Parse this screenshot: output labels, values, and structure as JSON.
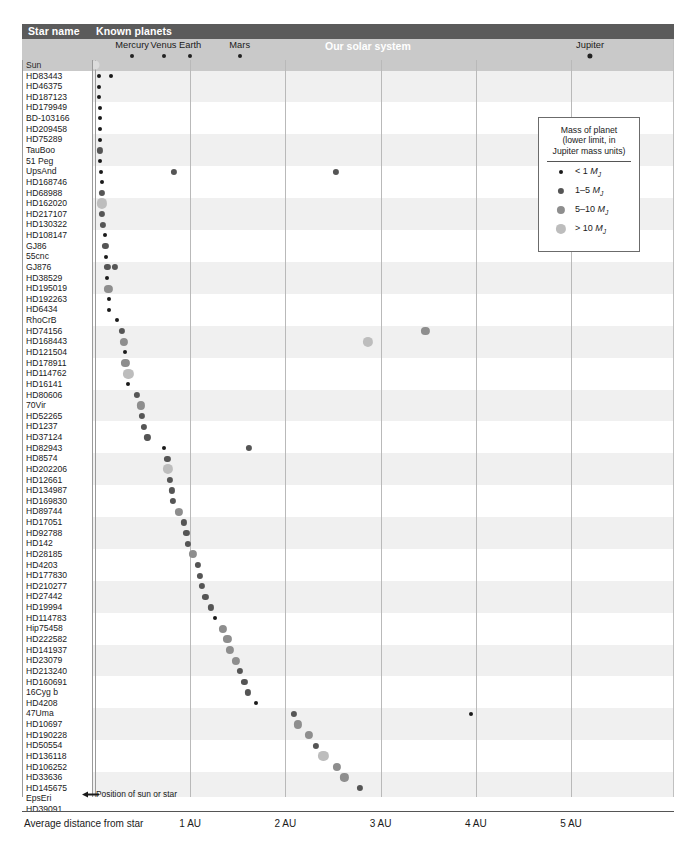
{
  "header": {
    "star_name_label": "Star name",
    "known_planets_label": "Known planets",
    "solar_system_label": "Our solar system"
  },
  "axis": {
    "title": "Average distance from star",
    "ticks": [
      {
        "label": "1 AU",
        "au": 1
      },
      {
        "label": "2 AU",
        "au": 2
      },
      {
        "label": "3 AU",
        "au": 3
      },
      {
        "label": "4 AU",
        "au": 4
      },
      {
        "label": "5 AU",
        "au": 5
      }
    ]
  },
  "annotation": {
    "pointer_text": "Position of sun or star"
  },
  "legend": {
    "title_line1": "Mass of planet",
    "title_line2": "(lower limit, in",
    "title_line3": "Jupiter mass units)",
    "entries": [
      {
        "label": "< 1",
        "unit": "MJ",
        "size": 4.0,
        "color": "#1a1a1a"
      },
      {
        "label": "1–5",
        "unit": "MJ",
        "size": 6.2,
        "color": "#555555"
      },
      {
        "label": "5–10",
        "unit": "MJ",
        "size": 8.2,
        "color": "#8e8e8e"
      },
      {
        "label": "> 10",
        "unit": "MJ",
        "size": 10.2,
        "color": "#bdbdbd"
      }
    ]
  },
  "chart_data": {
    "type": "scatter",
    "xlabel": "Average distance from star (AU)",
    "ylabel": "Star name",
    "xlim": [
      0,
      5.6
    ],
    "grid": true,
    "legend_position": "upper-right",
    "mass_classes": [
      {
        "name": "< 1 MJ",
        "color": "#1a1a1a",
        "size": 4.0
      },
      {
        "name": "1-5 MJ",
        "color": "#555555",
        "size": 6.2
      },
      {
        "name": "5-10 MJ",
        "color": "#8e8e8e",
        "size": 8.2
      },
      {
        "name": "> 10 MJ",
        "color": "#bdbdbd",
        "size": 10.2
      }
    ],
    "solar_system": {
      "star_label": "Sun",
      "planets": [
        {
          "name": "Mercury",
          "au": 0.39,
          "size": 4.0,
          "color": "#222222"
        },
        {
          "name": "Venus",
          "au": 0.72,
          "size": 4.0,
          "color": "#222222"
        },
        {
          "name": "Earth",
          "au": 1.0,
          "size": 4.0,
          "color": "#222222"
        },
        {
          "name": "Mars",
          "au": 1.52,
          "size": 4.0,
          "color": "#222222"
        },
        {
          "name": "Jupiter",
          "au": 5.2,
          "size": 5.2,
          "color": "#222222"
        }
      ]
    },
    "rows": [
      {
        "star": "HD83443",
        "planets": [
          {
            "au": 0.04,
            "m": 0
          },
          {
            "au": 0.17,
            "m": 0
          }
        ]
      },
      {
        "star": "HD46375",
        "planets": [
          {
            "au": 0.04,
            "m": 0
          }
        ]
      },
      {
        "star": "HD187123",
        "planets": [
          {
            "au": 0.04,
            "m": 0
          }
        ]
      },
      {
        "star": "HD179949",
        "planets": [
          {
            "au": 0.05,
            "m": 0
          }
        ]
      },
      {
        "star": "BD-103166",
        "planets": [
          {
            "au": 0.05,
            "m": 0
          }
        ]
      },
      {
        "star": "HD209458",
        "planets": [
          {
            "au": 0.05,
            "m": 0
          }
        ]
      },
      {
        "star": "HD75289",
        "planets": [
          {
            "au": 0.05,
            "m": 0
          }
        ]
      },
      {
        "star": "TauBoo",
        "planets": [
          {
            "au": 0.05,
            "m": 1
          }
        ]
      },
      {
        "star": "51 Peg",
        "planets": [
          {
            "au": 0.05,
            "m": 0
          }
        ]
      },
      {
        "star": "UpsAnd",
        "planets": [
          {
            "au": 0.06,
            "m": 0
          },
          {
            "au": 0.83,
            "m": 1
          },
          {
            "au": 2.53,
            "m": 1
          }
        ]
      },
      {
        "star": "HD168746",
        "planets": [
          {
            "au": 0.07,
            "m": 0
          }
        ]
      },
      {
        "star": "HD68988",
        "planets": [
          {
            "au": 0.07,
            "m": 1
          }
        ]
      },
      {
        "star": "HD162020",
        "planets": [
          {
            "au": 0.07,
            "m": 3
          }
        ]
      },
      {
        "star": "HD217107",
        "planets": [
          {
            "au": 0.07,
            "m": 1
          }
        ]
      },
      {
        "star": "HD130322",
        "planets": [
          {
            "au": 0.08,
            "m": 1
          }
        ]
      },
      {
        "star": "HD108147",
        "planets": [
          {
            "au": 0.1,
            "m": 0
          }
        ]
      },
      {
        "star": "GJ86",
        "planets": [
          {
            "au": 0.11,
            "m": 1
          }
        ]
      },
      {
        "star": "55cnc",
        "planets": [
          {
            "au": 0.12,
            "m": 0
          }
        ]
      },
      {
        "star": "GJ876",
        "planets": [
          {
            "au": 0.13,
            "m": 1
          },
          {
            "au": 0.21,
            "m": 1
          }
        ]
      },
      {
        "star": "HD38529",
        "planets": [
          {
            "au": 0.13,
            "m": 0
          }
        ]
      },
      {
        "star": "HD195019",
        "planets": [
          {
            "au": 0.14,
            "m": 2
          }
        ]
      },
      {
        "star": "HD192263",
        "planets": [
          {
            "au": 0.15,
            "m": 0
          }
        ]
      },
      {
        "star": "HD6434",
        "planets": [
          {
            "au": 0.15,
            "m": 0
          }
        ]
      },
      {
        "star": "RhoCrB",
        "planets": [
          {
            "au": 0.23,
            "m": 0
          }
        ]
      },
      {
        "star": "HD74156",
        "planets": [
          {
            "au": 0.28,
            "m": 1
          },
          {
            "au": 3.47,
            "m": 2
          }
        ]
      },
      {
        "star": "HD168443",
        "planets": [
          {
            "au": 0.3,
            "m": 2
          },
          {
            "au": 2.87,
            "m": 3
          }
        ]
      },
      {
        "star": "HD121504",
        "planets": [
          {
            "au": 0.32,
            "m": 0
          }
        ]
      },
      {
        "star": "HD178911",
        "planets": [
          {
            "au": 0.32,
            "m": 2
          }
        ]
      },
      {
        "star": "HD114762",
        "planets": [
          {
            "au": 0.35,
            "m": 3
          }
        ]
      },
      {
        "star": "HD16141",
        "planets": [
          {
            "au": 0.35,
            "m": 0
          }
        ]
      },
      {
        "star": "HD80606",
        "planets": [
          {
            "au": 0.44,
            "m": 1
          }
        ]
      },
      {
        "star": "70Vir",
        "planets": [
          {
            "au": 0.48,
            "m": 2
          }
        ]
      },
      {
        "star": "HD52265",
        "planets": [
          {
            "au": 0.49,
            "m": 1
          }
        ]
      },
      {
        "star": "HD1237",
        "planets": [
          {
            "au": 0.51,
            "m": 1
          }
        ]
      },
      {
        "star": "HD37124",
        "planets": [
          {
            "au": 0.55,
            "m": 1
          }
        ]
      },
      {
        "star": "HD82943",
        "planets": [
          {
            "au": 0.73,
            "m": 0
          },
          {
            "au": 1.62,
            "m": 1
          }
        ]
      },
      {
        "star": "HD8574",
        "planets": [
          {
            "au": 0.76,
            "m": 1
          }
        ]
      },
      {
        "star": "HD202206",
        "planets": [
          {
            "au": 0.77,
            "m": 3
          }
        ]
      },
      {
        "star": "HD12661",
        "planets": [
          {
            "au": 0.79,
            "m": 1
          }
        ]
      },
      {
        "star": "HD134987",
        "planets": [
          {
            "au": 0.81,
            "m": 1
          }
        ]
      },
      {
        "star": "HD169830",
        "planets": [
          {
            "au": 0.82,
            "m": 1
          }
        ]
      },
      {
        "star": "HD89744",
        "planets": [
          {
            "au": 0.88,
            "m": 2
          }
        ]
      },
      {
        "star": "HD17051",
        "planets": [
          {
            "au": 0.93,
            "m": 1
          }
        ]
      },
      {
        "star": "HD92788",
        "planets": [
          {
            "au": 0.96,
            "m": 1
          }
        ]
      },
      {
        "star": "HD142",
        "planets": [
          {
            "au": 0.98,
            "m": 1
          }
        ]
      },
      {
        "star": "HD28185",
        "planets": [
          {
            "au": 1.03,
            "m": 2
          }
        ]
      },
      {
        "star": "HD4203",
        "planets": [
          {
            "au": 1.08,
            "m": 1
          }
        ]
      },
      {
        "star": "HD177830",
        "planets": [
          {
            "au": 1.1,
            "m": 1
          }
        ]
      },
      {
        "star": "HD210277",
        "planets": [
          {
            "au": 1.12,
            "m": 1
          }
        ]
      },
      {
        "star": "HD27442",
        "planets": [
          {
            "au": 1.16,
            "m": 1
          }
        ]
      },
      {
        "star": "HD19994",
        "planets": [
          {
            "au": 1.22,
            "m": 1
          }
        ]
      },
      {
        "star": "HD114783",
        "planets": [
          {
            "au": 1.26,
            "m": 0
          }
        ]
      },
      {
        "star": "Hip75458",
        "planets": [
          {
            "au": 1.34,
            "m": 2
          }
        ]
      },
      {
        "star": "HD222582",
        "planets": [
          {
            "au": 1.39,
            "m": 2
          }
        ]
      },
      {
        "star": "HD141937",
        "planets": [
          {
            "au": 1.42,
            "m": 2
          }
        ]
      },
      {
        "star": "HD23079",
        "planets": [
          {
            "au": 1.48,
            "m": 2
          }
        ]
      },
      {
        "star": "HD213240",
        "planets": [
          {
            "au": 1.52,
            "m": 1
          }
        ]
      },
      {
        "star": "HD160691",
        "planets": [
          {
            "au": 1.57,
            "m": 1
          }
        ]
      },
      {
        "star": "16Cyg b",
        "planets": [
          {
            "au": 1.61,
            "m": 1
          }
        ]
      },
      {
        "star": "HD4208",
        "planets": [
          {
            "au": 1.69,
            "m": 0
          }
        ]
      },
      {
        "star": "47Uma",
        "planets": [
          {
            "au": 2.09,
            "m": 1
          },
          {
            "au": 3.95,
            "m": 0
          }
        ]
      },
      {
        "star": "HD10697",
        "planets": [
          {
            "au": 2.13,
            "m": 2
          }
        ]
      },
      {
        "star": "HD190228",
        "planets": [
          {
            "au": 2.25,
            "m": 2
          }
        ]
      },
      {
        "star": "HD50554",
        "planets": [
          {
            "au": 2.32,
            "m": 1
          }
        ]
      },
      {
        "star": "HD136118",
        "planets": [
          {
            "au": 2.4,
            "m": 3
          }
        ]
      },
      {
        "star": "HD106252",
        "planets": [
          {
            "au": 2.54,
            "m": 2
          }
        ]
      },
      {
        "star": "HD33636",
        "planets": [
          {
            "au": 2.62,
            "m": 2
          }
        ]
      },
      {
        "star": "HD145675",
        "planets": [
          {
            "au": 2.78,
            "m": 1
          }
        ]
      },
      {
        "star": "EpsEri",
        "planets": [
          {
            "au": 3.3,
            "m": 0
          }
        ]
      },
      {
        "star": "HD39091",
        "planets": [
          {
            "au": 3.45,
            "m": 2
          }
        ]
      }
    ]
  }
}
